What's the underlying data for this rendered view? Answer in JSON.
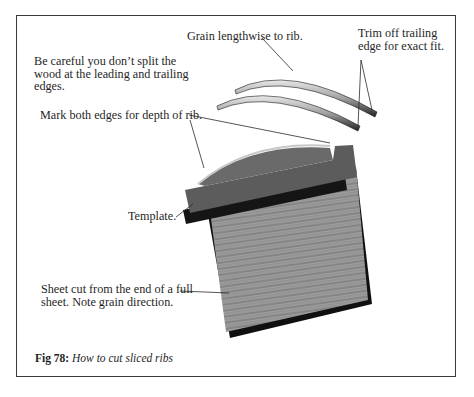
{
  "figure": {
    "number_label": "Fig 78:",
    "title": "How to cut sliced ribs"
  },
  "annotations": {
    "split_warning": {
      "lines": [
        "Be careful you don’t split the",
        "wood at the leading and trailing",
        "edges."
      ]
    },
    "grain": {
      "text": "Grain lengthwise to rib."
    },
    "trim": {
      "lines": [
        "Trim off trailing",
        "edge for exact fit."
      ]
    },
    "mark": {
      "text": "Mark both edges for depth of rib."
    },
    "template": {
      "text": "Template."
    },
    "sheet": {
      "lines": [
        "Sheet cut from the end of a full",
        "sheet. Note grain direction."
      ]
    }
  },
  "colors": {
    "frame": "#3a3a3a",
    "template_fill": "#5a5a5a",
    "sheet_fill": "#8f8f8f",
    "shadow": "#111111"
  }
}
